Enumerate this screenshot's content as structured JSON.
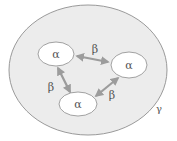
{
  "diagram": {
    "outer": {
      "label": "γ",
      "fill": "#ececec",
      "stroke": "#9a9a9a"
    },
    "nodes": [
      {
        "id": "n1",
        "label": "α",
        "cx": 56,
        "cy": 54,
        "rx": 18,
        "ry": 12
      },
      {
        "id": "n2",
        "label": "α",
        "cx": 129,
        "cy": 65,
        "rx": 18,
        "ry": 13
      },
      {
        "id": "n3",
        "label": "α",
        "cx": 78,
        "cy": 104,
        "rx": 19,
        "ry": 12
      }
    ],
    "edges": [
      {
        "from": "n1",
        "to": "n2",
        "label": "β",
        "type": "bidirectional"
      },
      {
        "from": "n1",
        "to": "n3",
        "label": "β",
        "type": "bidirectional"
      },
      {
        "from": "n3",
        "to": "n2",
        "label": "β",
        "type": "bidirectional"
      }
    ],
    "node_fill": "#ffffff",
    "node_stroke": "#8a8a8a",
    "arrow_color": "#9c9c9c"
  }
}
